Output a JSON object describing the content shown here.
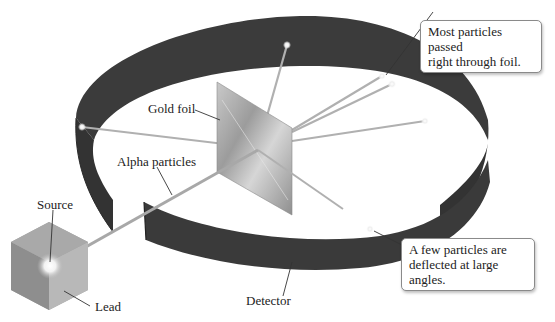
{
  "diagram": {
    "labels": {
      "gold_foil": "Gold foil",
      "alpha_particles": "Alpha particles",
      "source": "Source",
      "lead": "Lead",
      "detector": "Detector"
    },
    "callouts": {
      "most_passed_line1": "Most particles passed",
      "most_passed_line2": "right through foil.",
      "few_deflected_line1": "A few particles are",
      "few_deflected_line2": "deflected at large angles."
    },
    "colors": {
      "detector": "#3a3a3a",
      "foil": "#b8b8b8",
      "lead_box": "#9a9a9a",
      "beam": "#a8a8a8",
      "background": "#ffffff"
    }
  }
}
